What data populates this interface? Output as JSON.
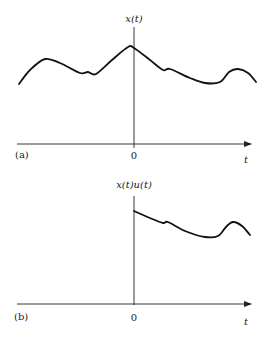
{
  "figure": {
    "panels": [
      {
        "id": "a",
        "panel_label": "(a)",
        "y_axis_label": "x(t)",
        "origin_label": "0",
        "x_axis_label": "t",
        "curve_points": [
          [
            19,
            84
          ],
          [
            30,
            70
          ],
          [
            45,
            59
          ],
          [
            60,
            63
          ],
          [
            80,
            73
          ],
          [
            88,
            72
          ],
          [
            96,
            74
          ],
          [
            112,
            60
          ],
          [
            128,
            47
          ],
          [
            134,
            48
          ],
          [
            150,
            60
          ],
          [
            163,
            70
          ],
          [
            170,
            69
          ],
          [
            190,
            78
          ],
          [
            205,
            83
          ],
          [
            220,
            82
          ],
          [
            229,
            72
          ],
          [
            238,
            69
          ],
          [
            248,
            73
          ],
          [
            256,
            82
          ]
        ]
      },
      {
        "id": "b",
        "panel_label": "(b)",
        "y_axis_label": "x(t)u(t)",
        "origin_label": "0",
        "x_axis_label": "t",
        "curve_points": [
          [
            134,
            211
          ],
          [
            150,
            218
          ],
          [
            163,
            223
          ],
          [
            168,
            222
          ],
          [
            185,
            231
          ],
          [
            205,
            237
          ],
          [
            218,
            236
          ],
          [
            226,
            227
          ],
          [
            233,
            222
          ],
          [
            242,
            226
          ],
          [
            250,
            235
          ]
        ]
      }
    ],
    "colors": {
      "curve": "#111111",
      "axis": "#222222",
      "background": "#ffffff"
    }
  }
}
